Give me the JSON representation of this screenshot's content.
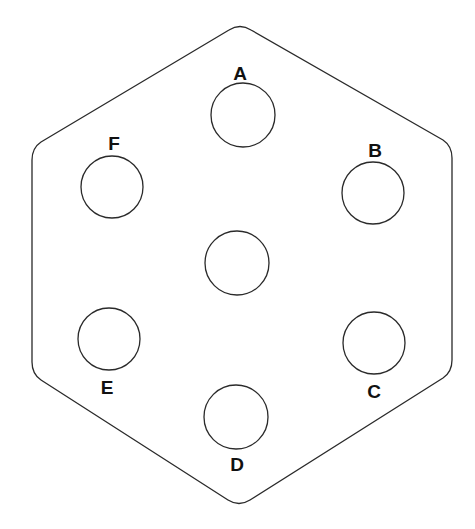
{
  "diagram": {
    "title": "",
    "shape": "hexagon-plate",
    "holes": [
      {
        "id": "A",
        "label": "A",
        "position": "top"
      },
      {
        "id": "B",
        "label": "B",
        "position": "upper-right"
      },
      {
        "id": "C",
        "label": "C",
        "position": "lower-right"
      },
      {
        "id": "D",
        "label": "D",
        "position": "bottom"
      },
      {
        "id": "E",
        "label": "E",
        "position": "lower-left"
      },
      {
        "id": "F",
        "label": "F",
        "position": "upper-left"
      },
      {
        "id": "center",
        "label": "",
        "position": "center"
      }
    ],
    "colors": {
      "stroke": "#2a2a2a",
      "fill": "#ffffff",
      "text": "#111111"
    }
  }
}
